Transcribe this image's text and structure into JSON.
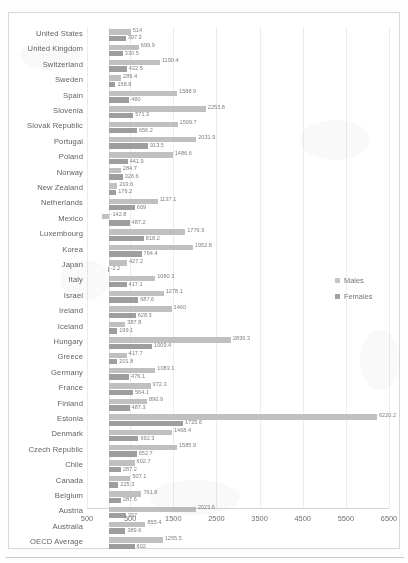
{
  "chart_data": {
    "type": "bar",
    "orientation": "horizontal",
    "title": "",
    "xlabel": "",
    "ylabel": "",
    "xlim": [
      -500,
      6500
    ],
    "xticks": [
      -500,
      500,
      1500,
      2500,
      3500,
      4500,
      5500,
      6500
    ],
    "xtick_labels": [
      "500",
      "500",
      "1500",
      "2500",
      "3500",
      "4500",
      "5500",
      "6500"
    ],
    "grid": true,
    "legend_position": "right",
    "categories": [
      "United States",
      "United Kingdom",
      "Switzerland",
      "Sweden",
      "Spain",
      "Slovenia",
      "Slovak Republic",
      "Portugal",
      "Poland",
      "Norway",
      "New Zealand",
      "Netherlands",
      "Mexico",
      "Luxembourg",
      "Korea",
      "Japan",
      "Italy",
      "Israel",
      "Ireland",
      "Iceland",
      "Hungary",
      "Greece",
      "Germany",
      "France",
      "Finland",
      "Estonia",
      "Denmark",
      "Czech Republic",
      "Chile",
      "Canada",
      "Belgium",
      "Austria",
      "Australia",
      "OECD Average"
    ],
    "series": [
      {
        "name": "Males",
        "color": "#b9bbbd",
        "values": [
          514,
          699.9,
          1190.4,
          289.4,
          1588.9,
          2253.8,
          1599.7,
          2031.9,
          1486.6,
          284.7,
          203.6,
          1137.1,
          -142.8,
          1776.9,
          1952.8,
          427.2,
          1080.3,
          1278.1,
          1460,
          387.8,
          2836.3,
          417.7,
          1083.1,
          972.3,
          890.9,
          6220.2,
          1468.4,
          1585.9,
          602.7,
          507.1,
          761.8,
          2023.6,
          855.4,
          1255.5
        ]
      },
      {
        "name": "Females",
        "color": "#8f9194",
        "values": [
          397.3,
          330.5,
          422.5,
          158.8,
          480.0,
          571.3,
          656.2,
          913.5,
          441.9,
          326.6,
          176.2,
          609.0,
          487.2,
          818.2,
          764.4,
          -2.2,
          417.1,
          687.6,
          628.3,
          199.1,
          1009.4,
          201.8,
          476.1,
          564.1,
          487.3,
          1725.6,
          692.3,
          652.7,
          287.2,
          225.3,
          287.6,
          397.0,
          389.6,
          602.0
        ]
      }
    ],
    "legend": [
      {
        "label": "Males",
        "color": "#b9bbbd"
      },
      {
        "label": "Females",
        "color": "#8f9194"
      }
    ]
  }
}
